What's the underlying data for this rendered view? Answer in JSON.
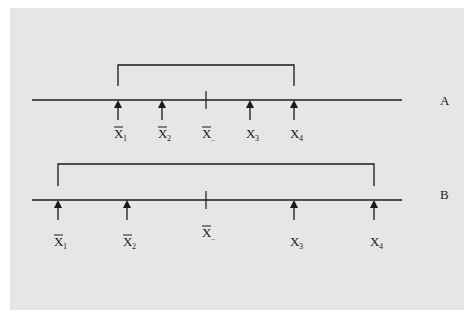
{
  "diagram": {
    "colors": {
      "background": "#e6e6e6",
      "ink": "#1a1a1a"
    },
    "rows": [
      {
        "label": "A",
        "grand_mean_label": {
          "base": "X",
          "sub": "..",
          "bar": true
        },
        "bracket": {
          "from": 0,
          "to": 3
        },
        "points": [
          {
            "base": "X",
            "sub": "1",
            "bar": true,
            "pos": 118
          },
          {
            "base": "X",
            "sub": "2",
            "bar": true,
            "pos": 162
          },
          {
            "base": "X",
            "sub": "3",
            "bar": false,
            "pos": 250
          },
          {
            "base": "X",
            "sub": "4",
            "bar": false,
            "pos": 294
          }
        ]
      },
      {
        "label": "B",
        "grand_mean_label": {
          "base": "X",
          "sub": "..",
          "bar": true
        },
        "bracket": {
          "from": 0,
          "to": 3
        },
        "points": [
          {
            "base": "X",
            "sub": "1",
            "bar": true,
            "pos": 58
          },
          {
            "base": "X",
            "sub": "2",
            "bar": true,
            "pos": 127
          },
          {
            "base": "X",
            "sub": "3",
            "bar": false,
            "pos": 294
          },
          {
            "base": "X",
            "sub": "4",
            "bar": false,
            "pos": 374
          }
        ]
      }
    ]
  }
}
